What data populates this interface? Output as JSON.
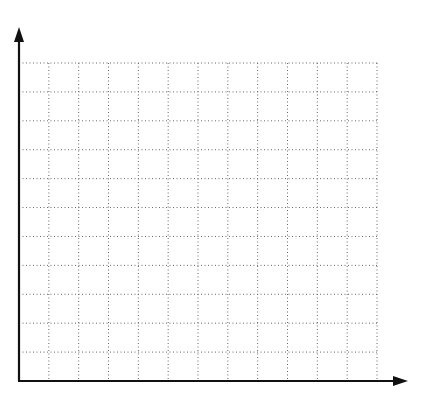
{
  "chart_data": {
    "type": "grid",
    "title": "",
    "xlabel": "",
    "ylabel": "",
    "grid": true,
    "grid_style": "dotted",
    "columns": 12,
    "rows": 11,
    "axes": {
      "x_arrow": true,
      "y_arrow": true
    },
    "tick_labels": {
      "x": [],
      "y": []
    },
    "data": []
  },
  "colors": {
    "axis": "#111111",
    "grid": "#666666",
    "background": "#ffffff"
  }
}
